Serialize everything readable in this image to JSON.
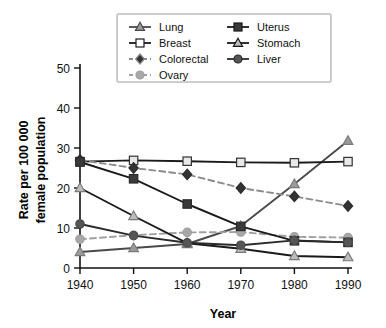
{
  "chart_data": {
    "type": "line",
    "title": "",
    "xlabel": "Year",
    "ylabel": "Rate per 100 000 female population",
    "x": [
      1940,
      1950,
      1960,
      1970,
      1980,
      1990
    ],
    "xtick_labels": [
      "1940",
      "1950",
      "1960",
      "1970",
      "1980",
      "1990"
    ],
    "ytick_labels": [
      "0",
      "10",
      "20",
      "30",
      "40",
      "50"
    ],
    "yticks": [
      0,
      10,
      20,
      30,
      40,
      50
    ],
    "xlim": [
      1940,
      1990
    ],
    "ylim": [
      0,
      50
    ],
    "grid": false,
    "legend_position": "top-center",
    "series": [
      {
        "name": "Lung",
        "values": [
          4.0,
          5.0,
          6.0,
          10.5,
          21.0,
          31.8
        ],
        "color": "#7a7a7a",
        "marker": "triangle",
        "marker_fill": "#9b9b9b",
        "line_style": "solid",
        "line_color": "#4a4a4a"
      },
      {
        "name": "Breast",
        "values": [
          26.6,
          26.9,
          26.7,
          26.4,
          26.3,
          26.6
        ],
        "color": "#333333",
        "marker": "square-open",
        "marker_fill": "#e8e8e8",
        "line_style": "solid",
        "line_color": "#1a1a1a"
      },
      {
        "name": "Colorectal",
        "values": [
          27.0,
          25.0,
          23.4,
          20.0,
          17.9,
          15.5
        ],
        "color": "#2b2b2b",
        "marker": "diamond",
        "marker_fill": "#333333",
        "line_style": "dashed",
        "line_color": "#8c8c8c"
      },
      {
        "name": "Ovary",
        "values": [
          7.2,
          8.2,
          8.9,
          9.0,
          7.8,
          7.6
        ],
        "color": "#9e9e9e",
        "marker": "circle",
        "marker_fill": "#a8a8a8",
        "line_style": "dashed",
        "line_color": "#a0a0a0"
      },
      {
        "name": "Uterus",
        "values": [
          26.5,
          22.3,
          16.0,
          10.4,
          6.8,
          6.4
        ],
        "color": "#2b2b2b",
        "marker": "square",
        "marker_fill": "#3a3a3a",
        "line_style": "solid",
        "line_color": "#1a1a1a"
      },
      {
        "name": "Stomach",
        "values": [
          20.0,
          13.0,
          6.2,
          4.8,
          3.0,
          2.7
        ],
        "color": "#7a7a7a",
        "marker": "triangle-open",
        "marker_fill": "#bdbdbd",
        "line_style": "solid",
        "line_color": "#1a1a1a"
      },
      {
        "name": "Liver",
        "values": [
          11.0,
          8.1,
          6.3,
          5.7,
          6.9,
          6.4
        ],
        "color": "#4a4a4a",
        "marker": "circle",
        "marker_fill": "#555555",
        "line_style": "solid",
        "line_color": "#2a2a2a"
      }
    ]
  },
  "legend": {
    "entries": [
      {
        "label": "Lung",
        "marker": "triangle",
        "fill": "#9b9b9b",
        "line": "#4a4a4a",
        "dash": "none"
      },
      {
        "label": "Uterus",
        "marker": "square",
        "fill": "#3a3a3a",
        "line": "#1a1a1a",
        "dash": "none"
      },
      {
        "label": "Breast",
        "marker": "square-open",
        "fill": "#ffffff",
        "line": "#1a1a1a",
        "dash": "none"
      },
      {
        "label": "Stomach",
        "marker": "triangle-open",
        "fill": "#bdbdbd",
        "line": "#1a1a1a",
        "dash": "none"
      },
      {
        "label": "Colorectal",
        "marker": "diamond",
        "fill": "#333333",
        "line": "#8c8c8c",
        "dash": "dashed"
      },
      {
        "label": "Liver",
        "marker": "circle",
        "fill": "#555555",
        "line": "#2a2a2a",
        "dash": "none"
      },
      {
        "label": "Ovary",
        "marker": "circle",
        "fill": "#a8a8a8",
        "line": "#a0a0a0",
        "dash": "dashed"
      }
    ]
  },
  "axis_titles": {
    "x": "Year",
    "y_line1": "Rate per 100 000",
    "y_line2": "female population"
  }
}
